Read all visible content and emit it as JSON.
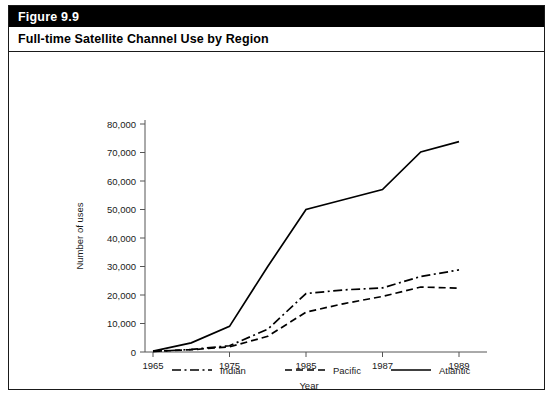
{
  "figure": {
    "number_label": "Figure 9.9",
    "title": "Full-time Satellite Channel Use by Region"
  },
  "chart_data": {
    "type": "line",
    "title": "Full-time Satellite Channel Use by Region",
    "xlabel": "Year",
    "ylabel": "Number of uses",
    "xticklabels": [
      "1965",
      "1975",
      "1985",
      "1987",
      "1989"
    ],
    "yticklabels": [
      "0",
      "10,000",
      "20,000",
      "30,000",
      "40,000",
      "50,000",
      "60,000",
      "70,000",
      "80,000"
    ],
    "yticks": [
      0,
      10000,
      20000,
      30000,
      40000,
      50000,
      60000,
      70000,
      80000
    ],
    "ylim": [
      0,
      80000
    ],
    "grid": false,
    "legend_position": "bottom",
    "x_positions": [
      0,
      0.5,
      1,
      1.5,
      2,
      2.5,
      3,
      3.5,
      4
    ],
    "x_point_years": [
      "1965",
      "1970",
      "1975",
      "1980",
      "1985",
      "1986",
      "1987",
      "1988",
      "1990"
    ],
    "series": [
      {
        "name": "Indian",
        "linestyle": "dashdot",
        "color": "#000000",
        "values": [
          200,
          900,
          2200,
          8000,
          20500,
          21800,
          22500,
          26500,
          28800
        ]
      },
      {
        "name": "Pacific",
        "linestyle": "dashed",
        "color": "#000000",
        "values": [
          200,
          800,
          1800,
          5500,
          14000,
          17000,
          19500,
          22800,
          22400
        ]
      },
      {
        "name": "Atlantic",
        "linestyle": "solid",
        "color": "#000000",
        "values": [
          300,
          3200,
          9000,
          30000,
          50000,
          53500,
          57000,
          70200,
          73800
        ]
      }
    ]
  },
  "legend": {
    "items": [
      {
        "label": "Indian",
        "style": "dashdot"
      },
      {
        "label": "Pacific",
        "style": "dashed"
      },
      {
        "label": "Atlantic",
        "style": "solid"
      }
    ]
  }
}
